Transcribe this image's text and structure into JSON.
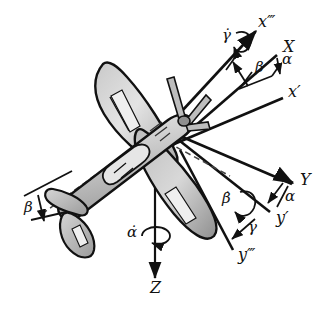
{
  "figure": {
    "background": "#ffffff",
    "ink": "#111111"
  },
  "colors": {
    "outline": "#111111",
    "body_light": "#d9d9d9",
    "body_mid": "#bdbdbd",
    "body_dark": "#9a9a9a",
    "highlight": "#efefef",
    "axis": "#111111"
  },
  "axes": [
    {
      "id": "x3",
      "label": "x‴",
      "x": 258,
      "y": 22,
      "size": "big"
    },
    {
      "id": "X",
      "label": "X",
      "x": 283,
      "y": 47,
      "size": "big"
    },
    {
      "id": "x1",
      "label": "x′",
      "x": 288,
      "y": 92,
      "size": "big"
    },
    {
      "id": "Y",
      "label": "Y",
      "x": 300,
      "y": 180,
      "size": "big"
    },
    {
      "id": "y1",
      "label": "y′",
      "x": 276,
      "y": 218,
      "size": "big"
    },
    {
      "id": "y3",
      "label": "y‴",
      "x": 238,
      "y": 255,
      "size": "big"
    },
    {
      "id": "Z",
      "label": "Z",
      "x": 150,
      "y": 288,
      "size": "big"
    }
  ],
  "angles": [
    {
      "id": "beta-upper",
      "label": "β",
      "x": 255,
      "y": 68,
      "size": "mid"
    },
    {
      "id": "alpha-upper",
      "label": "α",
      "x": 282,
      "y": 60,
      "size": "mid"
    },
    {
      "id": "alpha-right",
      "label": "α",
      "x": 285,
      "y": 197,
      "size": "mid"
    },
    {
      "id": "gamma-right",
      "label": "γ",
      "x": 248,
      "y": 228,
      "size": "mid"
    },
    {
      "id": "beta-left",
      "label": "β",
      "x": 24,
      "y": 208,
      "size": "mid"
    }
  ],
  "rates": [
    {
      "id": "gamma-dot",
      "label": "γ̇",
      "x": 222,
      "y": 36,
      "size": "mid",
      "spin": "gamma-spin-arrow"
    },
    {
      "id": "beta-dot",
      "label": "β̇",
      "x": 222,
      "y": 199,
      "size": "mid",
      "spin": "beta-spin-arrow"
    },
    {
      "id": "alpha-dot",
      "label": "α̇",
      "x": 127,
      "y": 233,
      "size": "mid",
      "spin": "alpha-spin-ellipse"
    }
  ],
  "icons": {
    "spin_arrows": [
      "gamma-spin-arrow",
      "beta-spin-arrow",
      "alpha-spin-ellipse"
    ],
    "axis_arrowheads": [
      "x-arrowhead",
      "y-arrowhead",
      "z-arrowhead"
    ]
  }
}
